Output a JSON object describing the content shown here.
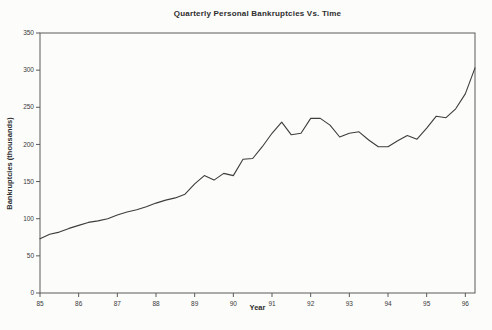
{
  "chart_data": {
    "type": "line",
    "title": "Quarterly Personal Bankruptcies Vs. Time",
    "xlabel": "Year",
    "ylabel": "Bankruptcies (thousands)",
    "xlim": [
      85,
      96.25
    ],
    "ylim": [
      0,
      350
    ],
    "grid": false,
    "legend": "none",
    "x_ticks": [
      85,
      86,
      87,
      88,
      89,
      90,
      91,
      92,
      93,
      94,
      95,
      96
    ],
    "x_tick_labels": [
      "85",
      "86",
      "87",
      "88",
      "89",
      "90",
      "91",
      "92",
      "93",
      "94",
      "95",
      "96"
    ],
    "y_ticks": [
      0,
      50,
      100,
      150,
      200,
      250,
      300,
      350
    ],
    "y_tick_labels": [
      "0",
      "50",
      "100",
      "150",
      "200",
      "250",
      "300",
      "350"
    ],
    "series": [
      {
        "name": "Quarterly personal bankruptcies",
        "x": [
          85.0,
          85.25,
          85.5,
          85.75,
          86.0,
          86.25,
          86.5,
          86.75,
          87.0,
          87.25,
          87.5,
          87.75,
          88.0,
          88.25,
          88.5,
          88.75,
          89.0,
          89.25,
          89.5,
          89.75,
          90.0,
          90.25,
          90.5,
          90.75,
          91.0,
          91.25,
          91.5,
          91.75,
          92.0,
          92.25,
          92.5,
          92.75,
          93.0,
          93.25,
          93.5,
          93.75,
          94.0,
          94.25,
          94.5,
          94.75,
          95.0,
          95.25,
          95.5,
          95.75,
          96.0,
          96.25
        ],
        "y": [
          73,
          79,
          82,
          87,
          91,
          95,
          97,
          100,
          105,
          109,
          112,
          116,
          121,
          125,
          128,
          133,
          147,
          158,
          152,
          161,
          158,
          180,
          181,
          197,
          215,
          230,
          213,
          215,
          235,
          235,
          226,
          210,
          215,
          217,
          206,
          197,
          197,
          205,
          212,
          207,
          222,
          238,
          236,
          248,
          268,
          303
        ]
      }
    ],
    "colors": {
      "line": "#3d3d3d",
      "axis": "#5a5a5a",
      "background": "#fcfcfb",
      "text": "#2e2e2e"
    },
    "layout": {
      "plot_left": 40,
      "plot_top": 33,
      "plot_right": 475,
      "plot_bottom": 293,
      "width": 492,
      "height": 330
    }
  }
}
